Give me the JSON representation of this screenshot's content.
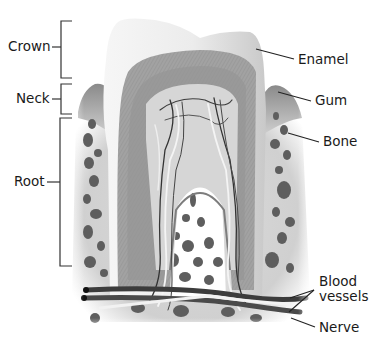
{
  "diagram": {
    "left_labels": [
      {
        "id": "crown",
        "text": "Crown",
        "bracket": [
          21,
          78
        ]
      },
      {
        "id": "neck",
        "text": "Neck",
        "bracket": [
          84,
          114
        ]
      },
      {
        "id": "root",
        "text": "Root",
        "bracket": [
          118,
          266
        ]
      }
    ],
    "right_labels": [
      {
        "id": "enamel",
        "text": "Enamel"
      },
      {
        "id": "gum",
        "text": "Gum"
      },
      {
        "id": "bone",
        "text": "Bone"
      },
      {
        "id": "blood-vessels",
        "line1": "Blood",
        "line2": "vessels"
      },
      {
        "id": "nerve",
        "text": "Nerve"
      }
    ],
    "colors": {
      "enamel": "#efefef",
      "dentin": "#a9a9a9",
      "dentin_inner": "#8f8f8f",
      "pulp": "#d4d4d4",
      "bone": "#d9d9d9",
      "bone_hole": "#5a5a5a",
      "gum": "#9a9a9a",
      "leader": "#222222"
    }
  }
}
